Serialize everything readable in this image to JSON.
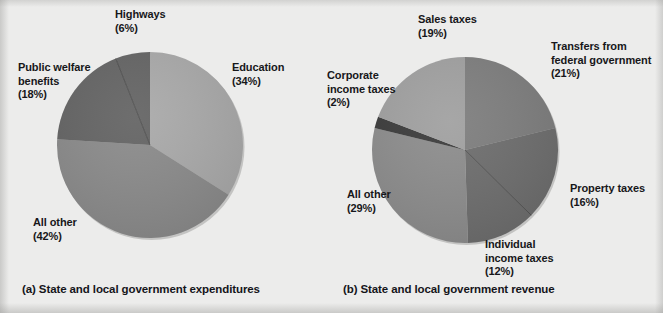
{
  "figure": {
    "background_color": "#ececeb",
    "text_color": "#17171a"
  },
  "panels": [
    {
      "id": "a",
      "caption": "(a) State and local government expenditures",
      "pie": {
        "center_x": 150,
        "center_y": 145,
        "radius": 95
      }
    },
    {
      "id": "b",
      "caption": "(b) State and local government revenue",
      "pie": {
        "center_x": 132,
        "center_y": 150,
        "radius": 95
      }
    }
  ],
  "chart_data": [
    {
      "type": "pie",
      "title": "(a) State and local government expenditures",
      "total_pct": 100,
      "start_angle_deg": 0,
      "direction": "clockwise",
      "categories": [
        "Education",
        "All other",
        "Public welfare benefits",
        "Highways"
      ],
      "values": [
        34,
        42,
        18,
        6
      ],
      "labels": [
        "(34%)",
        "(42%)",
        "(18%)",
        "(6%)"
      ],
      "colors": [
        "#a9a9a9",
        "#8a8a8a",
        "#636363",
        "#636363"
      ],
      "slices": [
        {
          "name": "Education",
          "value": 34,
          "pct_label": "(34%)",
          "color": "#a9a9a9"
        },
        {
          "name": "All other",
          "value": 42,
          "pct_label": "(42%)",
          "color": "#8a8a8a"
        },
        {
          "name": "Public welfare benefits",
          "value": 18,
          "pct_label": "(18%)",
          "color": "#636363"
        },
        {
          "name": "Highways",
          "value": 6,
          "pct_label": "(6%)",
          "color": "#636363"
        }
      ],
      "labels_text": {
        "highways": "Highways",
        "highways_pct": "(6%)",
        "public_welfare_line1": "Public welfare",
        "public_welfare_line2": "benefits",
        "public_welfare_pct": "(18%)",
        "education": "Education",
        "education_pct": "(34%)",
        "all_other": "All other",
        "all_other_pct": "(42%)"
      },
      "legend": "none",
      "grid": false
    },
    {
      "type": "pie",
      "title": "(b) State and local government revenue",
      "total_pct": 99,
      "start_angle_deg": 0,
      "direction": "clockwise",
      "categories": [
        "Transfers from federal government",
        "Property taxes",
        "Individual income taxes",
        "All other",
        "Corporate income taxes",
        "Sales taxes"
      ],
      "values": [
        21,
        16,
        12,
        29,
        2,
        19
      ],
      "labels": [
        "(21%)",
        "(16%)",
        "(12%)",
        "(29%)",
        "(2%)",
        "(19%)"
      ],
      "colors": [
        "#7d7d7d",
        "#6d6d6d",
        "#6d6d6d",
        "#8c8c8c",
        "#3a3a3a",
        "#a0a0a0"
      ],
      "slices": [
        {
          "name": "Transfers from federal government",
          "value": 21,
          "pct_label": "(21%)",
          "color": "#7d7d7d"
        },
        {
          "name": "Property taxes",
          "value": 16,
          "pct_label": "(16%)",
          "color": "#6d6d6d"
        },
        {
          "name": "Individual income taxes",
          "value": 12,
          "pct_label": "(12%)",
          "color": "#6d6d6d"
        },
        {
          "name": "All other",
          "value": 29,
          "pct_label": "(29%)",
          "color": "#8c8c8c"
        },
        {
          "name": "Corporate income taxes",
          "value": 2,
          "pct_label": "(2%)",
          "color": "#3a3a3a"
        },
        {
          "name": "Sales taxes",
          "value": 19,
          "pct_label": "(19%)",
          "color": "#a0a0a0"
        }
      ],
      "labels_text": {
        "sales_taxes": "Sales taxes",
        "sales_taxes_pct": "(19%)",
        "transfers_line1": "Transfers from",
        "transfers_line2": "federal government",
        "transfers_pct": "(21%)",
        "corporate_line1": "Corporate",
        "corporate_line2": "income taxes",
        "corporate_pct": "(2%)",
        "property_taxes": "Property taxes",
        "property_taxes_pct": "(16%)",
        "individual_line1": "Individual",
        "individual_line2": "income taxes",
        "individual_pct": "(12%)",
        "all_other": "All other",
        "all_other_pct": "(29%)"
      },
      "legend": "none",
      "grid": false
    }
  ]
}
